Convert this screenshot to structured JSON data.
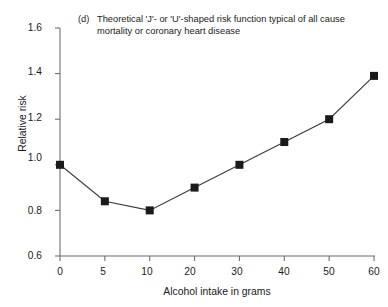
{
  "figure": {
    "panel_label": "(d)",
    "caption": "Theoretical 'J'- or 'U'-shaped risk function typical of all cause mortality or coronary heart disease"
  },
  "chart_data": {
    "type": "line",
    "title": "(d) Theoretical 'J'- or 'U'-shaped risk function typical of all cause mortality or coronary heart disease",
    "xlabel": "Alcohol intake in grams",
    "ylabel": "Relative risk",
    "categories": [
      "0",
      "5",
      "10",
      "20",
      "30",
      "40",
      "50",
      "60"
    ],
    "x": [
      0,
      5,
      10,
      20,
      30,
      40,
      50,
      60
    ],
    "values": [
      1.0,
      0.84,
      0.8,
      0.9,
      1.0,
      1.1,
      1.2,
      1.39
    ],
    "xtick_labels": [
      "0",
      "5",
      "10",
      "20",
      "30",
      "40",
      "50",
      "60"
    ],
    "ytick_labels": [
      "0.6",
      "0.8",
      "1.0",
      "1.2",
      "1.4",
      "1.6"
    ],
    "ytick_values": [
      0.6,
      0.8,
      1.0,
      1.2,
      1.4,
      1.6
    ],
    "ylim": [
      0.6,
      1.6
    ],
    "x_axis_scale": "ordinal",
    "grid": false,
    "legend": false,
    "marker": "square",
    "marker_color": "#1a1a1a",
    "line_color": "#3a3a3a",
    "axis_color": "#6f6f6f",
    "background": "#ffffff"
  },
  "ticks": {
    "y": [
      {
        "label": "0.6",
        "top": 250
      },
      {
        "label": "0.8",
        "top": 205
      },
      {
        "label": "1.0",
        "top": 152
      },
      {
        "label": "1.2",
        "top": 112
      },
      {
        "label": "1.4",
        "top": 66
      },
      {
        "label": "1.6",
        "top": 22
      }
    ],
    "x": [
      {
        "label": "0",
        "left": 45
      },
      {
        "label": "5",
        "left": 88
      },
      {
        "label": "10",
        "left": 132
      },
      {
        "label": "20",
        "left": 175
      },
      {
        "label": "30",
        "left": 222
      },
      {
        "label": "40",
        "left": 269
      },
      {
        "label": "50",
        "left": 314
      },
      {
        "label": "60",
        "left": 359
      }
    ]
  }
}
